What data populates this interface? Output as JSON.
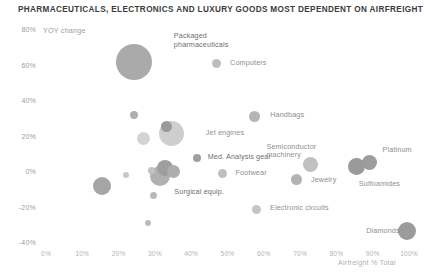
{
  "chart_data": {
    "type": "scatter",
    "title": "PHARMACEUTICALS, ELECTRONICS AND LUXURY GOODS MOST DEPENDENT ON AIRFREIGHT",
    "xlabel": "Airfreight % Total",
    "ylabel": "YOY change",
    "xlim": [
      0,
      100
    ],
    "ylim": [
      -40,
      80
    ],
    "grid": false,
    "legend": "none",
    "xticks": [
      "0%",
      "10%",
      "20%",
      "30%",
      "40%",
      "50%",
      "60%",
      "70%",
      "80%",
      "90%",
      "100%"
    ],
    "yticks": [
      "80%",
      "60%",
      "40%",
      "20%",
      "0%",
      "-20%",
      "-40%"
    ],
    "bubble_color": "#a9a9a9",
    "points": [
      {
        "label": "Packaged\npharmaceuticals",
        "x": 24.2,
        "y": 62.0,
        "size": 36,
        "color": "#aaaaaa",
        "label_dx": 22,
        "label_dy": -30,
        "label_dark": true
      },
      {
        "label": "Computers",
        "x": 47.0,
        "y": 61.0,
        "size": 9,
        "color": "#bdbdbd",
        "label_dx": 9,
        "label_dy": -5,
        "label_dark": false
      },
      {
        "label": "Handbags",
        "x": 57.5,
        "y": 31.5,
        "size": 11,
        "color": "#b5b5b5",
        "label_dx": 10,
        "label_dy": -5,
        "label_dark": false
      },
      {
        "label": "Jet engines",
        "x": 34.5,
        "y": 21.5,
        "size": 25,
        "color": "#cecece",
        "label_dx": 22,
        "label_dy": -5,
        "label_dark": false
      },
      {
        "label": "",
        "x": 33.3,
        "y": 25.5,
        "size": 11,
        "color": "#9a9a9a",
        "label_dx": 0,
        "label_dy": 0,
        "label_dark": false
      },
      {
        "label": "",
        "x": 24.3,
        "y": 32.0,
        "size": 8,
        "color": "#b0b0b0",
        "label_dx": 0,
        "label_dy": 0,
        "label_dark": false
      },
      {
        "label": "",
        "x": 26.8,
        "y": 19.0,
        "size": 13,
        "color": "#d3d3d3",
        "label_dx": 0,
        "label_dy": 0,
        "label_dark": false
      },
      {
        "label": "Med. Analysis gear",
        "x": 41.5,
        "y": 8.0,
        "size": 8,
        "color": "#9f9f9f",
        "label_dx": 7,
        "label_dy": -5,
        "label_dark": true
      },
      {
        "label": "Semiconductor\nmachinery",
        "x": 73.0,
        "y": 4.0,
        "size": 15,
        "color": "#c0c0c0",
        "label_dx": -52,
        "label_dy": -22,
        "label_dark": false
      },
      {
        "label": "Platinum",
        "x": 89.0,
        "y": 5.5,
        "size": 15,
        "color": "#9d9d9d",
        "label_dx": 6,
        "label_dy": -16,
        "label_dark": false
      },
      {
        "label": "Sulfoamides",
        "x": 85.5,
        "y": 3.0,
        "size": 17,
        "color": "#9a9a9a",
        "label_dx": -6,
        "label_dy": 13,
        "label_dark": false
      },
      {
        "label": "Jewelry",
        "x": 69.0,
        "y": -4.5,
        "size": 11,
        "color": "#b3b3b3",
        "label_dx": 9,
        "label_dy": -4,
        "label_dark": false
      },
      {
        "label": "Footwear",
        "x": 48.5,
        "y": -1.0,
        "size": 9,
        "color": "#bfbfbf",
        "label_dx": 9,
        "label_dy": -5,
        "label_dark": false
      },
      {
        "label": "Surgical equip.",
        "x": 31.5,
        "y": -2.0,
        "size": 20,
        "color": "#b1b1b1",
        "label_dx": 4,
        "label_dy": 12,
        "label_dark": true
      },
      {
        "label": "",
        "x": 32.8,
        "y": 2.0,
        "size": 16,
        "color": "#9e9e9e",
        "label_dx": 0,
        "label_dy": 0,
        "label_dark": false
      },
      {
        "label": "",
        "x": 35.0,
        "y": 0.5,
        "size": 13,
        "color": "#adadad",
        "label_dx": 0,
        "label_dy": 0,
        "label_dark": false
      },
      {
        "label": "",
        "x": 29.0,
        "y": 1.0,
        "size": 7,
        "color": "#c2c2c2",
        "label_dx": 0,
        "label_dy": 0,
        "label_dark": false
      },
      {
        "label": "",
        "x": 22.0,
        "y": -1.5,
        "size": 6,
        "color": "#c8c8c8",
        "label_dx": 0,
        "label_dy": 0,
        "label_dark": false
      },
      {
        "label": "",
        "x": 15.5,
        "y": -8.0,
        "size": 18,
        "color": "#a5a5a5",
        "label_dx": 0,
        "label_dy": 0,
        "label_dark": false
      },
      {
        "label": "",
        "x": 29.5,
        "y": -13.0,
        "size": 7,
        "color": "#b9b9b9",
        "label_dx": 0,
        "label_dy": 0,
        "label_dark": false
      },
      {
        "label": "",
        "x": 28.0,
        "y": -29.0,
        "size": 6,
        "color": "#bcbcbc",
        "label_dx": 0,
        "label_dy": 0,
        "label_dark": false
      },
      {
        "label": "Electronic circuits",
        "x": 58.0,
        "y": -21.0,
        "size": 9,
        "color": "#c5c5c5",
        "label_dx": 9,
        "label_dy": -5,
        "label_dark": false
      },
      {
        "label": "Diamonds",
        "x": 99.5,
        "y": -33.0,
        "size": 18,
        "color": "#9b9b9b",
        "label_dx": -50,
        "label_dy": -4,
        "label_dark": false
      }
    ]
  }
}
